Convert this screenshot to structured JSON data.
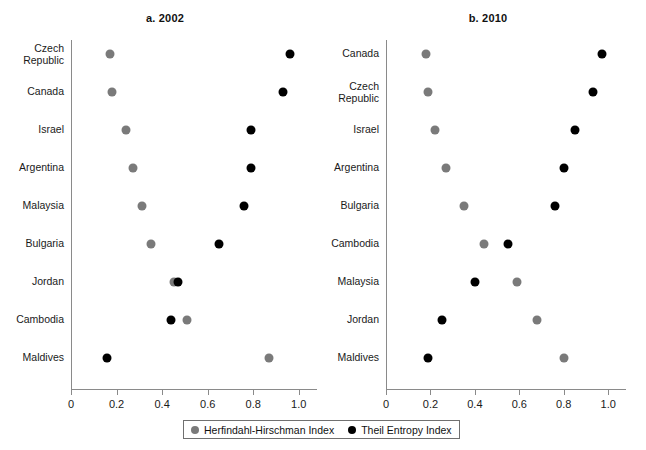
{
  "chart_data": [
    {
      "type": "scatter",
      "title": "a. 2002",
      "xlabel": "",
      "ylabel": "",
      "xlim": [
        0,
        1.08
      ],
      "xticks": [
        0,
        0.2,
        0.4,
        0.6,
        0.8,
        1.0
      ],
      "xtick_labels": [
        "0",
        "0.2",
        "0.4",
        "0.6",
        "0.8",
        "1.0"
      ],
      "grid": false,
      "categories": [
        "Czech\nRepublic",
        "Canada",
        "Israel",
        "Argentina",
        "Malaysia",
        "Bulgaria",
        "Jordan",
        "Cambodia",
        "Maldives"
      ],
      "series": [
        {
          "name": "Herfindahl-Hirschman Index",
          "color": "#7a7a7a",
          "values": [
            0.17,
            0.18,
            0.24,
            0.27,
            0.31,
            0.35,
            0.45,
            0.51,
            0.87
          ]
        },
        {
          "name": "Theil Entropy Index",
          "color": "#000000",
          "values": [
            0.96,
            0.93,
            0.79,
            0.79,
            0.76,
            0.65,
            0.47,
            0.44,
            0.16
          ]
        }
      ]
    },
    {
      "type": "scatter",
      "title": "b. 2010",
      "xlabel": "",
      "ylabel": "",
      "xlim": [
        0,
        1.08
      ],
      "xticks": [
        0,
        0.2,
        0.4,
        0.6,
        0.8,
        1.0
      ],
      "xtick_labels": [
        "0",
        "0.2",
        "0.4",
        "0.6",
        "0.8",
        "1.0"
      ],
      "grid": false,
      "categories": [
        "Canada",
        "Czech\nRepublic",
        "Israel",
        "Argentina",
        "Bulgaria",
        "Cambodia",
        "Malaysia",
        "Jordan",
        "Maldives"
      ],
      "series": [
        {
          "name": "Herfindahl-Hirschman Index",
          "color": "#7a7a7a",
          "values": [
            0.18,
            0.19,
            0.22,
            0.27,
            0.35,
            0.44,
            0.59,
            0.68,
            0.8
          ]
        },
        {
          "name": "Theil Entropy Index",
          "color": "#000000",
          "values": [
            0.97,
            0.93,
            0.85,
            0.8,
            0.76,
            0.55,
            0.4,
            0.25,
            0.19
          ]
        }
      ]
    }
  ],
  "legend": {
    "entries": [
      {
        "label": "Herfindahl-Hirschman Index",
        "marker": "gray-circle-icon",
        "color": "#7a7a7a"
      },
      {
        "label": "Theil Entropy Index",
        "marker": "black-circle-icon",
        "color": "#000000"
      }
    ]
  }
}
